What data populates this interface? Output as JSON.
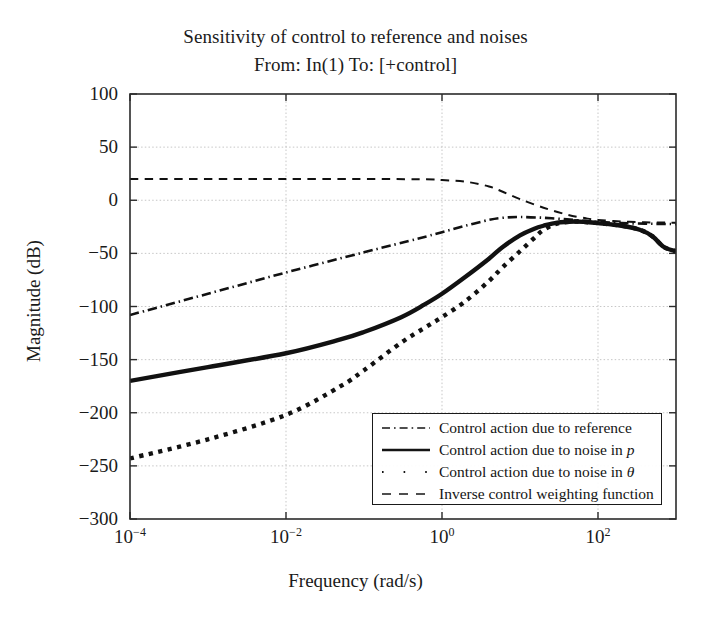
{
  "figure": {
    "title": "Sensitivity of control to reference and noises",
    "subtitle": "From: In(1) To: [+control]"
  },
  "chart_data": {
    "type": "line",
    "title": "Sensitivity of control to reference and noises",
    "subtitle": "From: In(1) To: [+control]",
    "xlabel": "Frequency (rad/s)",
    "ylabel": "Magnitude (dB)",
    "xscale": "log",
    "xlim": [
      0.0001,
      1000
    ],
    "ylim": [
      -300,
      100
    ],
    "yticks": [
      100,
      50,
      0,
      -50,
      -100,
      -150,
      -200,
      -250,
      -300
    ],
    "ytick_labels": [
      "100",
      "50",
      "0",
      "-50",
      "-100",
      "-150",
      "-200",
      "-250",
      "-300"
    ],
    "xticks": [
      0.0001,
      0.01,
      1,
      100
    ],
    "xtick_labels": [
      "10-4",
      "10-2",
      "100",
      "102"
    ],
    "xtick_mantissa": "10",
    "xtick_exponents": [
      "-4",
      "-2",
      "0",
      "2"
    ],
    "grid": true,
    "legend_position": "lower right",
    "series": [
      {
        "name": "Control action due to reference",
        "style": "dashdot",
        "width": 2.6,
        "color": "#111111",
        "points": [
          [
            0.0001,
            -108
          ],
          [
            0.001,
            -88
          ],
          [
            0.01,
            -68
          ],
          [
            0.1,
            -49
          ],
          [
            0.5,
            -36
          ],
          [
            1,
            -30
          ],
          [
            2,
            -24
          ],
          [
            4,
            -18.5
          ],
          [
            6,
            -16.5
          ],
          [
            10,
            -15.8
          ],
          [
            20,
            -16.5
          ],
          [
            40,
            -18
          ],
          [
            70,
            -19.5
          ],
          [
            100,
            -20.5
          ],
          [
            200,
            -21.5
          ],
          [
            400,
            -22
          ],
          [
            700,
            -22.3
          ],
          [
            1000,
            -22.5
          ]
        ]
      },
      {
        "name": "Control action due to noise in p",
        "style": "solid",
        "width": 4.4,
        "color": "#111111",
        "points": [
          [
            0.0001,
            -170
          ],
          [
            0.001,
            -157
          ],
          [
            0.01,
            -144
          ],
          [
            0.05,
            -131
          ],
          [
            0.1,
            -124
          ],
          [
            0.3,
            -110
          ],
          [
            0.6,
            -98
          ],
          [
            1,
            -88
          ],
          [
            2,
            -72
          ],
          [
            4,
            -55
          ],
          [
            6,
            -44
          ],
          [
            10,
            -33
          ],
          [
            15,
            -27
          ],
          [
            20,
            -24
          ],
          [
            30,
            -21
          ],
          [
            50,
            -20
          ],
          [
            70,
            -20.5
          ],
          [
            100,
            -21.5
          ],
          [
            200,
            -24
          ],
          [
            350,
            -28
          ],
          [
            500,
            -34
          ],
          [
            700,
            -44
          ],
          [
            1000,
            -48
          ]
        ]
      },
      {
        "name": "Control action due to noise in theta",
        "style": "dotted",
        "width": 4.4,
        "color": "#111111",
        "points": [
          [
            0.0001,
            -243
          ],
          [
            0.001,
            -225
          ],
          [
            0.01,
            -202
          ],
          [
            0.05,
            -175
          ],
          [
            0.1,
            -160
          ],
          [
            0.3,
            -134
          ],
          [
            0.6,
            -120
          ],
          [
            1,
            -110
          ],
          [
            2,
            -95
          ],
          [
            4,
            -76
          ],
          [
            6,
            -63
          ],
          [
            10,
            -48
          ],
          [
            15,
            -36
          ],
          [
            20,
            -28
          ],
          [
            30,
            -22
          ],
          [
            50,
            -20
          ],
          [
            70,
            -20.5
          ],
          [
            100,
            -21.5
          ],
          [
            200,
            -24
          ],
          [
            350,
            -28
          ],
          [
            500,
            -34
          ],
          [
            700,
            -44
          ],
          [
            1000,
            -48
          ]
        ]
      },
      {
        "name": "Inverse control weighting function",
        "style": "dashed",
        "width": 2.0,
        "color": "#111111",
        "points": [
          [
            0.0001,
            20
          ],
          [
            0.01,
            20
          ],
          [
            0.5,
            19.8
          ],
          [
            1,
            19
          ],
          [
            2,
            17.5
          ],
          [
            4,
            13
          ],
          [
            6,
            8
          ],
          [
            10,
            1
          ],
          [
            20,
            -7
          ],
          [
            40,
            -13.5
          ],
          [
            70,
            -17
          ],
          [
            100,
            -18.5
          ],
          [
            200,
            -20
          ],
          [
            400,
            -20.8
          ],
          [
            700,
            -21
          ],
          [
            1000,
            -21.2
          ]
        ]
      }
    ]
  },
  "legend": {
    "entries": [
      {
        "label": "Control action due to reference",
        "style": "dashdot",
        "italic_suffix": ""
      },
      {
        "label": "Control action due to noise in ",
        "style": "solid",
        "italic_suffix": "p"
      },
      {
        "label": "Control action due to noise in ",
        "style": "dotted",
        "italic_suffix": "θ"
      },
      {
        "label": "Inverse control weighting function",
        "style": "dashed",
        "italic_suffix": ""
      }
    ]
  }
}
